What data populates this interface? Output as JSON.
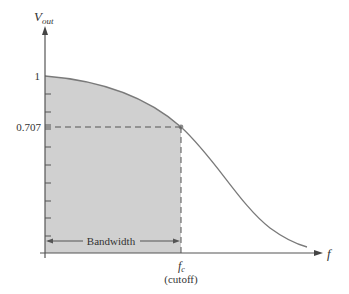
{
  "diagram": {
    "type": "low-pass frequency response",
    "y_axis_label": "V",
    "y_axis_subscript": "out",
    "x_axis_label": "f",
    "y_tick_labels": [
      "1",
      "0.707"
    ],
    "cutoff_label": "f",
    "cutoff_subscript": "c",
    "cutoff_note": "(cutoff)",
    "bandwidth_label": "Bandwidth",
    "colors": {
      "fill": "#cfcfcf",
      "curve": "#7a7a7a",
      "axis": "#555555",
      "dash": "#555555",
      "point": "#8a8a8a"
    }
  }
}
